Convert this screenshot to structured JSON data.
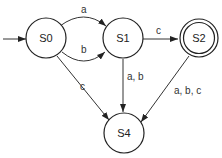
{
  "diagram": {
    "type": "finite-state-automaton",
    "states": [
      {
        "id": "S0",
        "label": "S0",
        "start": true,
        "accepting": false
      },
      {
        "id": "S1",
        "label": "S1",
        "start": false,
        "accepting": false
      },
      {
        "id": "S2",
        "label": "S2",
        "start": false,
        "accepting": true
      },
      {
        "id": "S4",
        "label": "S4",
        "start": false,
        "accepting": false
      }
    ],
    "transitions": [
      {
        "from": "S0",
        "to": "S1",
        "label": "a"
      },
      {
        "from": "S0",
        "to": "S1",
        "label": "b"
      },
      {
        "from": "S0",
        "to": "S4",
        "label": "c"
      },
      {
        "from": "S1",
        "to": "S2",
        "label": "c"
      },
      {
        "from": "S1",
        "to": "S4",
        "label": "a, b"
      },
      {
        "from": "S2",
        "to": "S4",
        "label": "a, b, c"
      }
    ],
    "colors": {
      "stroke": "#222222",
      "background": "#ffffff"
    }
  }
}
